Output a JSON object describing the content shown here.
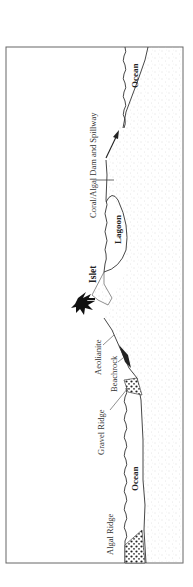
{
  "diagram": {
    "type": "geological cross-section (rotated 90°)",
    "labels": {
      "algal_ridge": "Algal Ridge",
      "ocean_left": "Ocean",
      "gravel_ridge": "Gravel Ridge",
      "beachrock": "Beachrock",
      "aeolianite": "Aeolianite",
      "islet": "Islet",
      "lagoon": "Lagoon",
      "dam_spillway": "Coral/Algal Dam and Spillway",
      "ocean_right": "Ocean"
    },
    "colors": {
      "line": "#333333",
      "stipple": "#c8c8c8",
      "frame": "#555555"
    }
  }
}
